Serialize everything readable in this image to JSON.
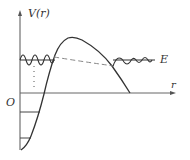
{
  "diagram": {
    "labels": {
      "y_axis": "V(r)",
      "x_axis": "r",
      "origin": "O",
      "energy": "E"
    },
    "colors": {
      "stroke": "#333333",
      "dashed": "#777777",
      "axis": "#555555",
      "background": "#ffffff"
    },
    "elements": [
      "vertical axis V(r) with arrow",
      "horizontal axis r with arrow",
      "potential well wall curve",
      "Coulomb barrier curve",
      "energy level line E",
      "oscillating wavefunction inside well",
      "decaying (dashed) wavefunction through barrier",
      "oscillating wavefunction outside barrier",
      "bound-level horizontal lines inside well",
      "dotted vertical line"
    ]
  }
}
